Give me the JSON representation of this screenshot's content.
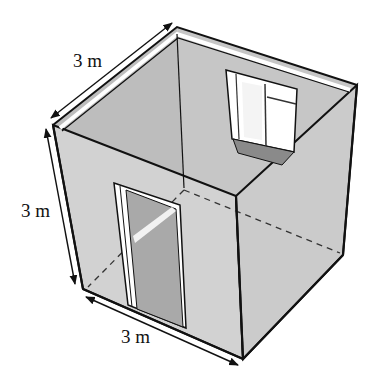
{
  "figure": {
    "dimensions": [
      {
        "id": "depth",
        "label": "3 m",
        "position": "top-left edge"
      },
      {
        "id": "height",
        "label": "3 m",
        "position": "left vertical edge"
      },
      {
        "id": "width",
        "label": "3 m",
        "position": "bottom edge"
      }
    ],
    "features": [
      "door",
      "window"
    ],
    "colors": {
      "wall_back": "#cfcfcf",
      "wall_left_front": "#d6d6d6",
      "wall_right_front": "#cdcdcd",
      "outline": "#111111",
      "opening": "#ffffff",
      "door_inside": "#a9a9a9",
      "window_sill": "#8a8a8a"
    }
  }
}
